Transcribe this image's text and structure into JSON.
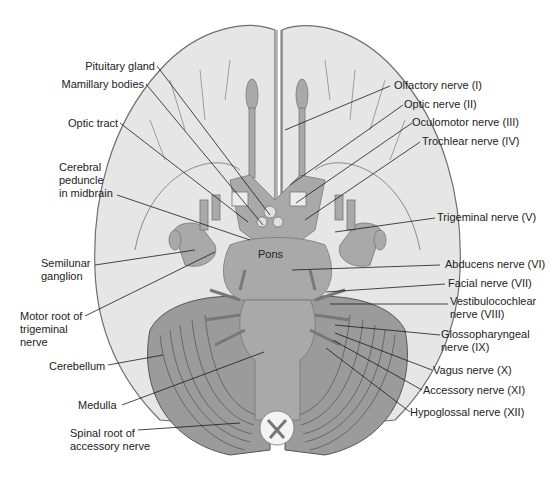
{
  "diagram": {
    "colors": {
      "background": "#ffffff",
      "cerebrum": "#e6e6e6",
      "outline": "#6e6e6e",
      "brainstem": "#a9a9a9",
      "cerebellum": "#9b9b9b",
      "leader_line": "#1a1a1a",
      "text": "#222222"
    },
    "center_label": "Pons",
    "labels_left": [
      {
        "id": "pituitary-gland",
        "text": "Pituitary gland"
      },
      {
        "id": "mamillary-bodies",
        "text": "Mamillary bodies"
      },
      {
        "id": "optic-tract",
        "text": "Optic tract"
      },
      {
        "id": "cerebral-peduncle",
        "text": "Cerebral\npeduncle\nin midbrain"
      },
      {
        "id": "semilunar-ganglion",
        "text": "Semilunar\nganglion"
      },
      {
        "id": "motor-root-trigeminal",
        "text": "Motor root of\ntrigeminal\nnerve"
      },
      {
        "id": "cerebellum",
        "text": "Cerebellum"
      },
      {
        "id": "medulla",
        "text": "Medulla"
      },
      {
        "id": "spinal-root-accessory",
        "text": "Spinal root of\naccessory nerve"
      }
    ],
    "labels_right": [
      {
        "id": "olfactory-nerve",
        "text": "Olfactory nerve (I)"
      },
      {
        "id": "optic-nerve",
        "text": "Optic nerve (II)"
      },
      {
        "id": "oculomotor-nerve",
        "text": "Oculomotor nerve (III)"
      },
      {
        "id": "trochlear-nerve",
        "text": "Trochlear nerve (IV)"
      },
      {
        "id": "trigeminal-nerve",
        "text": "Trigeminal nerve (V)"
      },
      {
        "id": "abducens-nerve",
        "text": "Abducens nerve (VI)"
      },
      {
        "id": "facial-nerve",
        "text": "Facial nerve (VII)"
      },
      {
        "id": "vestibulocochlear-nerve",
        "text": "Vestibulocochlear\nnerve (VIII)"
      },
      {
        "id": "glossopharyngeal-nerve",
        "text": "Glossopharyngeal\nnerve (IX)"
      },
      {
        "id": "vagus-nerve",
        "text": "Vagus nerve (X)"
      },
      {
        "id": "accessory-nerve",
        "text": "Accessory nerve (XI)"
      },
      {
        "id": "hypoglossal-nerve",
        "text": "Hypoglossal nerve (XII)"
      }
    ]
  }
}
